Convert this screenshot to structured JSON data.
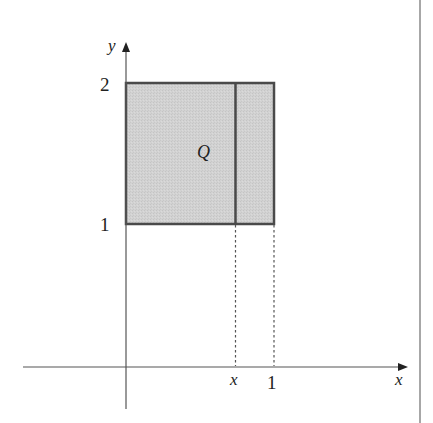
{
  "figure": {
    "type": "region-diagram",
    "colors": {
      "fill": "#cfcfcf",
      "stroke": "#4a4a4a",
      "axis": "#555555",
      "dashed": "#555555",
      "frame": "#8a8a8a"
    },
    "axes": {
      "x_label": "x",
      "y_label": "y"
    },
    "ticks": {
      "y_top": "2",
      "y_bottom": "1",
      "x_variable": "x",
      "x_one": "1"
    },
    "region": {
      "label": "Q",
      "x_range": [
        0,
        1
      ],
      "y_range": [
        1,
        2
      ]
    }
  }
}
